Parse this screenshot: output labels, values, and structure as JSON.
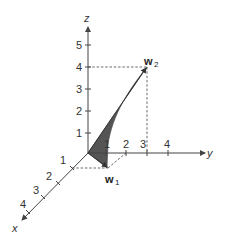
{
  "diagram": {
    "type": "3d-vector-plot",
    "axes": {
      "x": {
        "label": "x",
        "ticks": [
          "1",
          "2",
          "3",
          "4"
        ]
      },
      "y": {
        "label": "y",
        "ticks": [
          "1",
          "2",
          "3",
          "4"
        ]
      },
      "z": {
        "label": "z",
        "ticks": [
          "1",
          "2",
          "3",
          "4",
          "5"
        ]
      }
    },
    "vectors": [
      {
        "name": "w",
        "subscript": "1"
      },
      {
        "name": "w",
        "subscript": "2"
      }
    ],
    "colors": {
      "axis": "#444444",
      "shaded_region": "#555555",
      "text": "#333333"
    }
  }
}
